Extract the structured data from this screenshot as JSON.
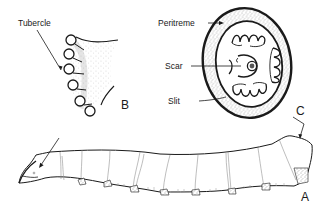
{
  "figure": {
    "panels": [
      {
        "id": "A",
        "label": "A",
        "description": "larva-side-view"
      },
      {
        "id": "B",
        "label": "B",
        "description": "proleg-with-tubercles"
      },
      {
        "id": "C",
        "label": "C",
        "description": "spiracle-detail"
      }
    ],
    "callouts": {
      "tubercle": "Tubercle",
      "peritreme": "Peritreme",
      "scar": "Scar",
      "slit": "Slit"
    },
    "colors": {
      "ink": "#1a1a1a",
      "stipple": "#555555",
      "background": "#ffffff"
    }
  }
}
